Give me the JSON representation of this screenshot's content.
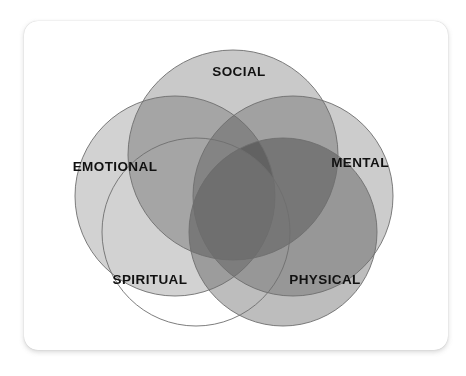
{
  "card": {
    "background": "#ffffff",
    "shadow_color": "#9a9a9a"
  },
  "diagram": {
    "title": "Five Dimensions of Wellness Venn Diagram",
    "stroke_color": "#6e6e6e",
    "label_color": "#111111",
    "center_overlap_color": "#6f6f6f"
  },
  "chart_data": {
    "type": "venn",
    "title": "Five Dimensions of Wellness",
    "set_count": 5,
    "sets": [
      {
        "label": "SOCIAL",
        "cx": 233,
        "cy": 155,
        "r": 105,
        "fill": "#c9c9c9",
        "filled": true,
        "label_x": 239,
        "label_y": 72
      },
      {
        "label": "EMOTIONAL",
        "cx": 175,
        "cy": 196,
        "r": 100,
        "fill": "#d2d2d2",
        "filled": true,
        "label_x": 115,
        "label_y": 167
      },
      {
        "label": "MENTAL",
        "cx": 293,
        "cy": 196,
        "r": 100,
        "fill": "#cccccc",
        "filled": true,
        "label_x": 360,
        "label_y": 163
      },
      {
        "label": "SPIRITUAL",
        "cx": 196,
        "cy": 232,
        "r": 94,
        "fill": "#ffffff",
        "filled": false,
        "label_x": 150,
        "label_y": 280
      },
      {
        "label": "PHYSICAL",
        "cx": 283,
        "cy": 232,
        "r": 94,
        "fill": "#bdbdbd",
        "filled": true,
        "label_x": 325,
        "label_y": 280
      }
    ],
    "center_intersection": {
      "label": "",
      "approx_x": 235,
      "approx_y": 195,
      "fill": "#6f6f6f",
      "shape": "pentagon"
    },
    "legend_position": "none",
    "grid": false
  }
}
